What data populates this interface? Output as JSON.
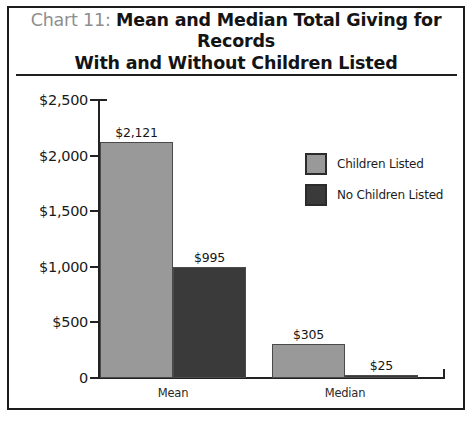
{
  "chart_data": {
    "type": "bar",
    "title": "Chart 11: Mean and Median Total Giving for Records With and Without Children Listed",
    "title_prefix": "Chart 11:",
    "title_main": "Mean and Median Total Giving for Records With and Without Children Listed",
    "title_line1": "Mean and Median Total Giving for Records",
    "title_line2": "With and Without Children Listed",
    "xlabel": "",
    "ylabel": "",
    "categories": [
      "Mean",
      "Median"
    ],
    "series": [
      {
        "name": "Children Listed",
        "color": "#999999",
        "values": [
          2121,
          305
        ],
        "labels": [
          "$2,121",
          "$305"
        ]
      },
      {
        "name": "No Children Listed",
        "color": "#3a3a3a",
        "values": [
          995,
          25
        ],
        "labels": [
          "$995",
          "$25"
        ]
      }
    ],
    "ylim": [
      0,
      2500
    ],
    "yticks": [
      0,
      500,
      1000,
      1500,
      2000,
      2500
    ],
    "ytick_labels": [
      "0",
      "$500",
      "$1,000",
      "$1,500",
      "$2,000",
      "$2,500"
    ],
    "grid": false,
    "legend_position": "upper right"
  },
  "legend": {
    "items": [
      {
        "label": "Children Listed",
        "color": "#999999"
      },
      {
        "label": "No Children Listed",
        "color": "#3a3a3a"
      }
    ]
  }
}
